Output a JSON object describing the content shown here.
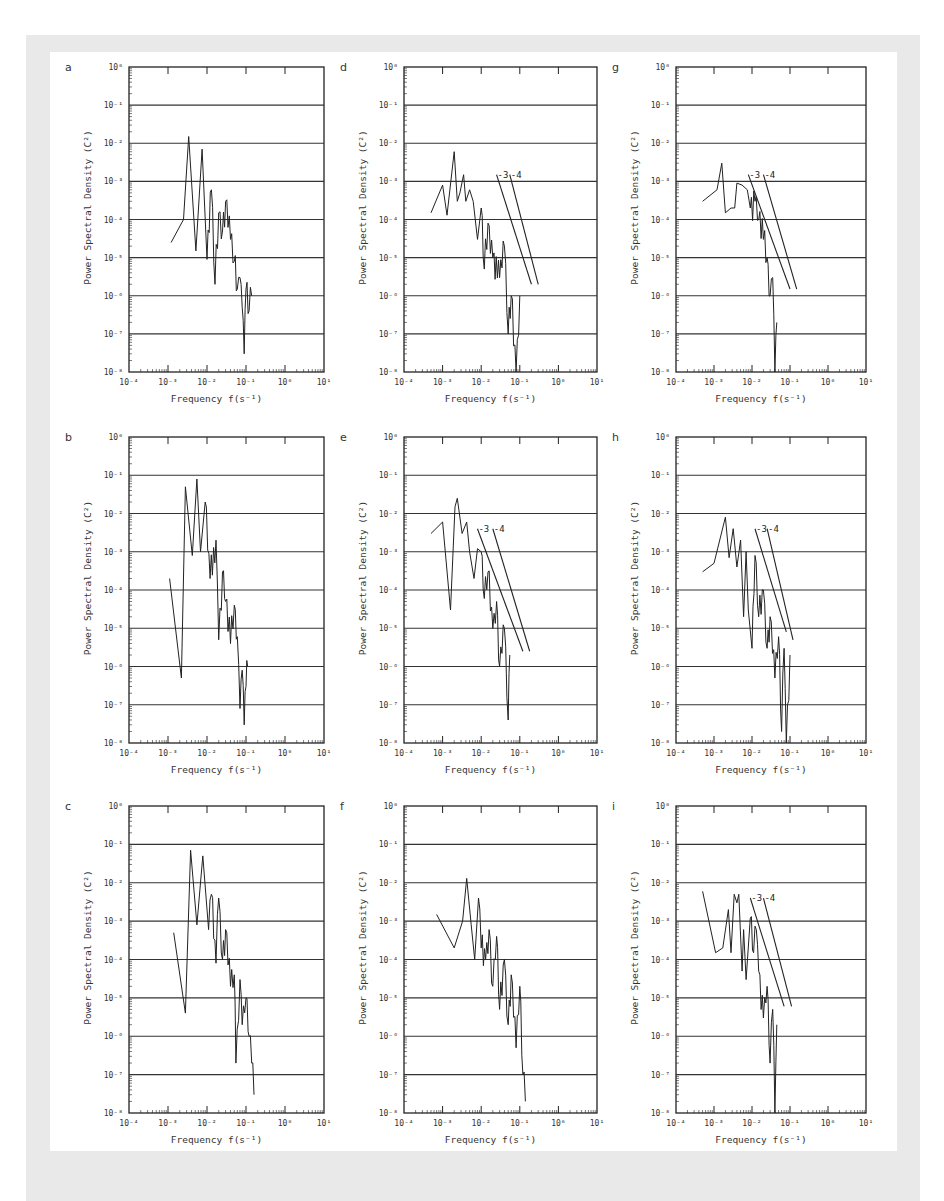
{
  "figure": {
    "colors": {
      "frame": "#e9e9e9",
      "sheet": "#ffffff",
      "ink": "#222222",
      "grid": "#333333"
    },
    "axis_common": {
      "xlabel": "Frequency",
      "xunit": "f(s⁻¹)",
      "ylabel": "Power Spectral Density",
      "yunit": "(C²)",
      "x_ticks": [
        "10⁻⁴",
        "10⁻³",
        "10⁻²",
        "10⁻¹",
        "10⁰",
        "10¹"
      ],
      "y_ticks": [
        "10⁰",
        "10⁻¹",
        "10⁻²",
        "10⁻³",
        "10⁻⁴",
        "10⁻⁵",
        "10⁻⁶",
        "10⁻⁷",
        "10⁻⁸"
      ]
    }
  },
  "chart_data": [
    {
      "panel": "a",
      "type": "line",
      "xscale": "log",
      "yscale": "log",
      "title": "",
      "xlabel": "Frequency f(s⁻¹)",
      "ylabel": "Power Spectral Density (C²)",
      "xlim": [
        0.0001,
        10
      ],
      "ylim": [
        1e-08,
        1
      ],
      "grid": "horizontal at each decade",
      "slope_lines": [],
      "x": [
        0.0012,
        0.0025,
        0.0034,
        0.0052,
        0.0075,
        0.01,
        0.013,
        0.016,
        0.02,
        0.025,
        0.03,
        0.04,
        0.05,
        0.06,
        0.07,
        0.08,
        0.09,
        0.1,
        0.12,
        0.14
      ],
      "y": [
        2.5e-05,
        0.0001,
        0.015,
        1.5e-05,
        0.007,
        9e-06,
        0.0006,
        2e-06,
        0.00015,
        5e-05,
        0.0003,
        3e-05,
        8e-06,
        1.5e-06,
        3e-06,
        5e-07,
        3e-08,
        1.5e-06,
        4e-07,
        1e-06
      ]
    },
    {
      "panel": "b",
      "type": "line",
      "xscale": "log",
      "yscale": "log",
      "xlabel": "Frequency f(s⁻¹)",
      "ylabel": "Power Spectral Density (C²)",
      "xlim": [
        0.0001,
        10
      ],
      "ylim": [
        1e-08,
        1
      ],
      "grid": "horizontal at each decade",
      "slope_lines": [],
      "x": [
        0.0011,
        0.0022,
        0.0028,
        0.0042,
        0.0055,
        0.0068,
        0.009,
        0.012,
        0.017,
        0.02,
        0.025,
        0.03,
        0.04,
        0.05,
        0.06,
        0.07,
        0.08,
        0.09,
        0.1,
        0.11
      ],
      "y": [
        0.0002,
        5e-07,
        0.05,
        0.0008,
        0.08,
        0.001,
        0.02,
        0.0002,
        0.002,
        5e-06,
        0.0003,
        5e-05,
        4e-06,
        4e-05,
        6e-06,
        8e-08,
        8e-07,
        3e-08,
        3e-07,
        1e-06
      ]
    },
    {
      "panel": "c",
      "type": "line",
      "xscale": "log",
      "yscale": "log",
      "xlabel": "Frequency f(s⁻¹)",
      "ylabel": "Power Spectral Density (C²)",
      "xlim": [
        0.0001,
        10
      ],
      "ylim": [
        1e-08,
        1
      ],
      "grid": "horizontal at each decade",
      "slope_lines": [],
      "x": [
        0.0014,
        0.0028,
        0.0038,
        0.0055,
        0.0078,
        0.011,
        0.013,
        0.017,
        0.02,
        0.025,
        0.03,
        0.04,
        0.05,
        0.055,
        0.07,
        0.08,
        0.1,
        0.12,
        0.14,
        0.16
      ],
      "y": [
        0.0005,
        4e-06,
        0.07,
        0.0008,
        0.05,
        0.0006,
        0.005,
        8e-05,
        0.004,
        0.0001,
        0.0006,
        2e-05,
        4e-05,
        2e-07,
        3e-05,
        2e-06,
        1e-05,
        1e-06,
        2e-07,
        3e-08
      ]
    },
    {
      "panel": "d",
      "type": "line",
      "xscale": "log",
      "yscale": "log",
      "xlabel": "Frequency f(s⁻¹)",
      "ylabel": "Power Spectral Density (C²)",
      "xlim": [
        0.0001,
        10
      ],
      "ylim": [
        1e-08,
        1
      ],
      "grid": "horizontal at each decade",
      "slope_lines": [
        {
          "label": "-3",
          "from": [
            0.025,
            0.0015
          ],
          "to": [
            0.2,
            2e-06
          ]
        },
        {
          "label": "-4",
          "from": [
            0.055,
            0.0015
          ],
          "to": [
            0.3,
            2e-06
          ]
        }
      ],
      "x": [
        0.0005,
        0.001,
        0.0013,
        0.002,
        0.0024,
        0.0028,
        0.0035,
        0.004,
        0.005,
        0.0062,
        0.008,
        0.01,
        0.012,
        0.015,
        0.02,
        0.03,
        0.04,
        0.05,
        0.06,
        0.08,
        0.1
      ],
      "y": [
        0.00015,
        0.0008,
        0.00013,
        0.006,
        0.0003,
        0.0005,
        0.0015,
        0.0003,
        0.0006,
        0.0003,
        3e-05,
        0.0002,
        5e-06,
        8e-05,
        1e-05,
        3e-06,
        2e-05,
        1e-07,
        1e-06,
        1e-08,
        1e-06
      ]
    },
    {
      "panel": "e",
      "type": "line",
      "xscale": "log",
      "yscale": "log",
      "xlabel": "Frequency f(s⁻¹)",
      "ylabel": "Power Spectral Density (C²)",
      "xlim": [
        0.0001,
        10
      ],
      "ylim": [
        1e-08,
        1
      ],
      "grid": "horizontal at each decade",
      "slope_lines": [
        {
          "label": "-3",
          "from": [
            0.008,
            0.004
          ],
          "to": [
            0.12,
            2.5e-06
          ]
        },
        {
          "label": "-4",
          "from": [
            0.02,
            0.004
          ],
          "to": [
            0.18,
            2.5e-06
          ]
        }
      ],
      "x": [
        0.0005,
        0.001,
        0.0016,
        0.0021,
        0.0024,
        0.0032,
        0.0042,
        0.005,
        0.0065,
        0.008,
        0.01,
        0.012,
        0.015,
        0.02,
        0.025,
        0.03,
        0.04,
        0.05,
        0.055
      ],
      "y": [
        0.003,
        0.006,
        3e-05,
        0.015,
        0.025,
        0.003,
        0.006,
        0.001,
        0.0002,
        0.0012,
        0.001,
        6e-05,
        0.0003,
        1e-05,
        5e-05,
        1e-06,
        1e-05,
        4e-08,
        2e-06
      ]
    },
    {
      "panel": "f",
      "type": "line",
      "xscale": "log",
      "yscale": "log",
      "xlabel": "Frequency f(s⁻¹)",
      "ylabel": "Power Spectral Density (C²)",
      "xlim": [
        0.0001,
        10
      ],
      "ylim": [
        1e-08,
        1
      ],
      "grid": "horizontal at each decade",
      "slope_lines": [],
      "x": [
        0.0007,
        0.002,
        0.0033,
        0.0042,
        0.0055,
        0.0068,
        0.0085,
        0.01,
        0.013,
        0.016,
        0.02,
        0.025,
        0.03,
        0.04,
        0.05,
        0.06,
        0.08,
        0.1,
        0.12,
        0.14
      ],
      "y": [
        0.0015,
        0.0002,
        0.001,
        0.013,
        0.0008,
        0.0001,
        0.004,
        0.0002,
        0.0001,
        0.0006,
        2e-05,
        0.0004,
        5e-06,
        0.0001,
        2e-06,
        4e-05,
        5e-07,
        2e-05,
        1e-07,
        2e-08
      ]
    },
    {
      "panel": "g",
      "type": "line",
      "xscale": "log",
      "yscale": "log",
      "xlabel": "Frequency f(s⁻¹)",
      "ylabel": "Power Spectral Density (C²)",
      "xlim": [
        0.0001,
        10
      ],
      "ylim": [
        1e-08,
        1
      ],
      "grid": "horizontal at each decade",
      "slope_lines": [
        {
          "label": "-3",
          "from": [
            0.008,
            0.0015
          ],
          "to": [
            0.1,
            1.5e-06
          ]
        },
        {
          "label": "-4",
          "from": [
            0.02,
            0.0015
          ],
          "to": [
            0.15,
            1.5e-06
          ]
        }
      ],
      "x": [
        0.0005,
        0.0012,
        0.0016,
        0.002,
        0.0028,
        0.0035,
        0.004,
        0.0055,
        0.0075,
        0.009,
        0.012,
        0.015,
        0.02,
        0.025,
        0.03,
        0.035,
        0.04,
        0.045
      ],
      "y": [
        0.0003,
        0.0006,
        0.003,
        0.00015,
        0.0002,
        0.0002,
        0.0009,
        0.0008,
        0.0006,
        0.0002,
        0.0003,
        0.0001,
        3e-05,
        1e-05,
        1e-06,
        3e-06,
        1e-08,
        2e-07
      ]
    },
    {
      "panel": "h",
      "type": "line",
      "xscale": "log",
      "yscale": "log",
      "xlabel": "Frequency f(s⁻¹)",
      "ylabel": "Power Spectral Density (C²)",
      "xlim": [
        0.0001,
        10
      ],
      "ylim": [
        1e-08,
        1
      ],
      "grid": "horizontal at each decade",
      "slope_lines": [
        {
          "label": "-3",
          "from": [
            0.012,
            0.004
          ],
          "to": [
            0.08,
            8e-06
          ]
        },
        {
          "label": "-4",
          "from": [
            0.025,
            0.004
          ],
          "to": [
            0.12,
            5e-06
          ]
        }
      ],
      "x": [
        0.0005,
        0.001,
        0.002,
        0.0025,
        0.0032,
        0.004,
        0.005,
        0.006,
        0.007,
        0.008,
        0.01,
        0.012,
        0.015,
        0.02,
        0.025,
        0.03,
        0.04,
        0.05,
        0.06,
        0.07,
        0.08,
        0.1
      ],
      "y": [
        0.0003,
        0.0005,
        0.008,
        0.0007,
        0.004,
        0.0004,
        0.002,
        2e-05,
        0.001,
        3e-05,
        3e-06,
        0.0008,
        2e-05,
        0.0001,
        3e-06,
        2e-05,
        5e-07,
        6e-06,
        2e-08,
        3e-06,
        1e-08,
        2e-06
      ]
    },
    {
      "panel": "i",
      "type": "line",
      "xscale": "log",
      "yscale": "log",
      "xlabel": "Frequency f(s⁻¹)",
      "ylabel": "Power Spectral Density (C²)",
      "xlim": [
        0.0001,
        10
      ],
      "ylim": [
        1e-08,
        1
      ],
      "grid": "horizontal at each decade",
      "slope_lines": [
        {
          "label": "-3",
          "from": [
            0.009,
            0.004
          ],
          "to": [
            0.07,
            6e-06
          ]
        },
        {
          "label": "-4",
          "from": [
            0.02,
            0.004
          ],
          "to": [
            0.11,
            6e-06
          ]
        }
      ],
      "x": [
        0.0005,
        0.0011,
        0.0017,
        0.0024,
        0.0028,
        0.0034,
        0.004,
        0.0045,
        0.0055,
        0.006,
        0.007,
        0.009,
        0.011,
        0.013,
        0.015,
        0.02,
        0.025,
        0.03,
        0.035,
        0.04,
        0.045
      ],
      "y": [
        0.006,
        0.00015,
        0.0002,
        0.002,
        0.00015,
        0.005,
        0.003,
        0.005,
        5e-05,
        0.0006,
        3e-05,
        0.0012,
        0.00015,
        0.0006,
        5e-05,
        3e-06,
        2e-05,
        2e-07,
        5e-06,
        1e-08,
        2e-06
      ]
    }
  ]
}
